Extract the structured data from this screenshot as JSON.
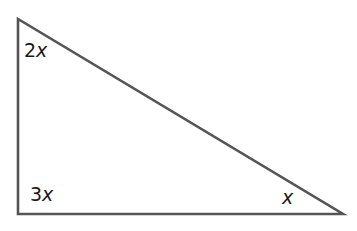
{
  "diagram": {
    "type": "right-triangle",
    "stroke_color": "#555555",
    "vertices": {
      "top": {
        "x": 18,
        "y": 19
      },
      "bottom_left": {
        "x": 18,
        "y": 214
      },
      "bottom_right": {
        "x": 343,
        "y": 214
      }
    },
    "angle_labels": {
      "top": {
        "coefficient": "2",
        "variable": "x"
      },
      "bottom_left": {
        "coefficient": "3",
        "variable": "x"
      },
      "bottom_right": {
        "coefficient": "",
        "variable": "x"
      }
    }
  }
}
